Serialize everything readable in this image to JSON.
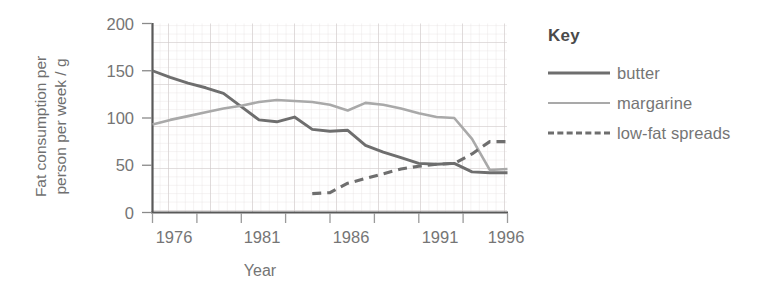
{
  "chart_data": {
    "type": "line",
    "title": "",
    "xlabel": "Year",
    "ylabel": "Fat consumption per person per week / g",
    "ylabel_line1": "Fat consumption per",
    "ylabel_line2": "person per week / g",
    "xlim": [
      1976,
      1996
    ],
    "ylim": [
      0,
      200
    ],
    "yticks": [
      0,
      50,
      100,
      150,
      200
    ],
    "xticks": [
      1976,
      1981,
      1986,
      1991,
      1996
    ],
    "xtick_labels": [
      "1976",
      "1981",
      "1986",
      "1991",
      "1996"
    ],
    "ytick_labels": [
      "0",
      "50",
      "100",
      "150",
      "200"
    ],
    "grid": true,
    "grid_style": "graph-paper",
    "legend_position": "right",
    "legend_title": "Key",
    "series": [
      {
        "name": "butter",
        "color": "#6e6e6e",
        "dash": "solid",
        "x": [
          1976,
          1977,
          1978,
          1979,
          1980,
          1981,
          1982,
          1983,
          1984,
          1985,
          1986,
          1987,
          1988,
          1989,
          1990,
          1991,
          1992,
          1993,
          1994,
          1995,
          1996
        ],
        "values": [
          150,
          143,
          137,
          132,
          126,
          112,
          98,
          96,
          101,
          88,
          86,
          87,
          71,
          64,
          58,
          52,
          51,
          52,
          43,
          42,
          42
        ]
      },
      {
        "name": "margarine",
        "color": "#a9a9a9",
        "dash": "solid",
        "x": [
          1976,
          1977,
          1978,
          1979,
          1980,
          1981,
          1982,
          1983,
          1984,
          1985,
          1986,
          1987,
          1988,
          1989,
          1990,
          1991,
          1992,
          1993,
          1994,
          1995,
          1996
        ],
        "values": [
          93,
          98,
          102,
          106,
          110,
          113,
          117,
          119,
          118,
          117,
          114,
          108,
          116,
          114,
          110,
          105,
          101,
          100,
          78,
          45,
          46
        ]
      },
      {
        "name": "low-fat spreads",
        "color": "#6e6e6e",
        "dash": "dashed",
        "x": [
          1985,
          1986,
          1987,
          1988,
          1989,
          1990,
          1991,
          1992,
          1993,
          1994,
          1995,
          1996
        ],
        "values": [
          20,
          21,
          31,
          36,
          41,
          46,
          49,
          51,
          52,
          62,
          75,
          75
        ]
      }
    ]
  },
  "legend": {
    "title": "Key",
    "entries": [
      {
        "label": "butter"
      },
      {
        "label": "margarine"
      },
      {
        "label": "low-fat spreads"
      }
    ]
  }
}
